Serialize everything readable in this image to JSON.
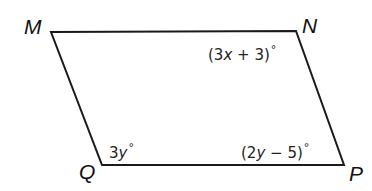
{
  "diagram": {
    "type": "parallelogram",
    "stroke_color": "#1a1a1a",
    "vertices": {
      "M": {
        "label": "M",
        "x": 51,
        "y": 32
      },
      "N": {
        "label": "N",
        "x": 296,
        "y": 31
      },
      "P": {
        "label": "P",
        "x": 344,
        "y": 165
      },
      "Q": {
        "label": "Q",
        "x": 102,
        "y": 165
      }
    },
    "angles": {
      "N": {
        "pre": "(3",
        "var": "x",
        "post": " + 3)",
        "degree": "°"
      },
      "Q": {
        "pre": "3",
        "var": "y",
        "post": "",
        "degree": "°"
      },
      "P": {
        "pre": "(2",
        "var": "y",
        "post": " − 5)",
        "degree": "°"
      }
    }
  }
}
